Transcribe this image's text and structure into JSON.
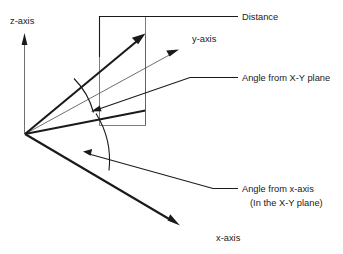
{
  "diagram": {
    "background_color": "#ffffff",
    "line_color": "#1a1a1a",
    "thin_line_color": "#5a5a5a",
    "labels": {
      "z_axis": "z-axis",
      "y_axis": "y-axis",
      "x_axis": "x-axis",
      "distance": "Distance",
      "angle_from_xy_plane": "Angle from X-Y plane",
      "angle_from_x_axis": "Angle from x-axis",
      "angle_from_x_axis_note": "(In the X-Y plane)"
    },
    "elements": {
      "z_axis_arrow": "z-axis-vertical-arrow",
      "y_axis_arrow": "y-axis-diagonal-arrow",
      "x_axis_arrow": "x-axis-diagonal-arrow",
      "distance_vector": "distance-vector-arrow",
      "vertical_plane": "x-y-reference-plane-rectangle",
      "elevation_arc": "elevation-angle-arc",
      "azimuth_arc": "azimuth-angle-arc",
      "distance_leader": "distance-leader-line",
      "elevation_leader": "elevation-angle-leader-line",
      "azimuth_leader": "azimuth-angle-leader-line"
    }
  }
}
